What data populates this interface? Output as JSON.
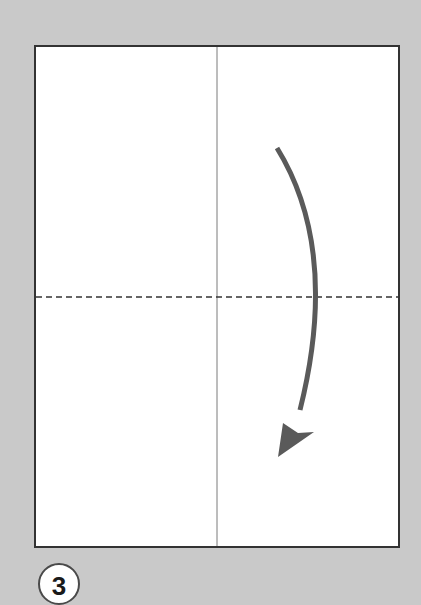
{
  "diagram": {
    "type": "origami-fold-step",
    "step_number": "3",
    "colors": {
      "background": "#c9c9c9",
      "paper": "#ffffff",
      "paper_border": "#333333",
      "crease_line": "#7a7a7a",
      "fold_line": "#333333",
      "arrow": "#5a5a5a",
      "badge_border": "#4a4a4a"
    },
    "paper": {
      "x": 35,
      "y": 46,
      "width": 364,
      "height": 501
    },
    "crease": {
      "orientation": "vertical",
      "x": 217
    },
    "valley_fold": {
      "orientation": "horizontal",
      "style": "dashed",
      "y": 297
    },
    "arrow": {
      "direction": "down",
      "meaning": "fold top half down along dashed line"
    }
  }
}
